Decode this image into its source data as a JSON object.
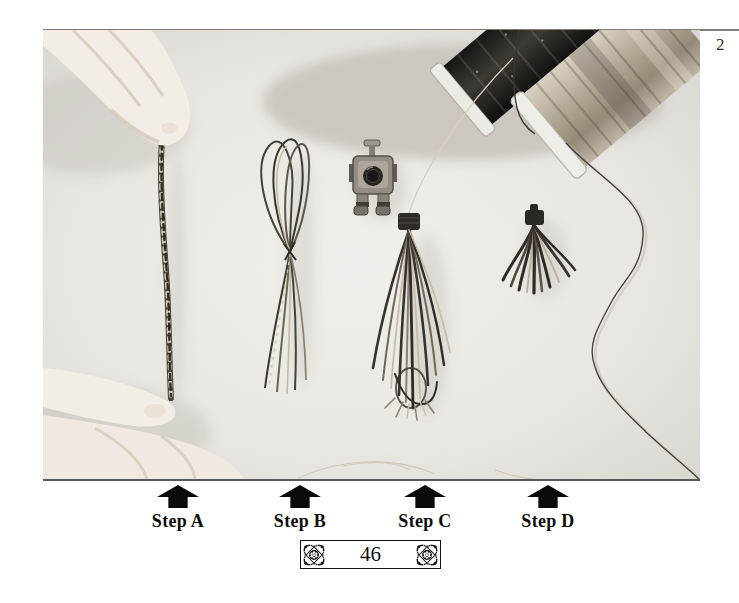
{
  "page": {
    "figure_number": "2",
    "folio_number": "46"
  },
  "steps": [
    {
      "label": "Step A"
    },
    {
      "label": "Step B"
    },
    {
      "label": "Step C"
    },
    {
      "label": "Step D"
    }
  ],
  "photo": {
    "alt": "Black-and-white photograph of tassel-making stages: hands holding a twisted thread bundle, a looped thread bundle, a long tassel beside a sewing-machine presser foot, a finished short tassel, and two spools of thread with a loose trailing thread"
  },
  "colors": {
    "arrow_black": "#0a0a0a",
    "rule_gray": "#7d7d7d",
    "text_black": "#141414",
    "page_white": "#ffffff",
    "photo_gray": "#e9e6e1"
  }
}
